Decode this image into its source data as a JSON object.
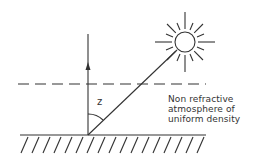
{
  "diagram": {
    "angle_label": "z",
    "caption_lines": [
      "Non refractive",
      "atmosphere of",
      "uniform density"
    ],
    "elements": {
      "sun": {
        "cx": 185,
        "cy": 42,
        "r": 10,
        "rays": 16
      },
      "zenith_arrow": {
        "x": 88,
        "y_top": 34,
        "y_bottom": 135
      },
      "sun_ray": {
        "from": [
          88,
          135
        ],
        "to": [
          176,
          51
        ]
      },
      "atmosphere_boundary": {
        "y": 84,
        "style": "dashed"
      },
      "ground": {
        "y": 135,
        "style": "hatched"
      }
    },
    "colors": {
      "stroke": "#333333",
      "background": "#ffffff"
    }
  }
}
